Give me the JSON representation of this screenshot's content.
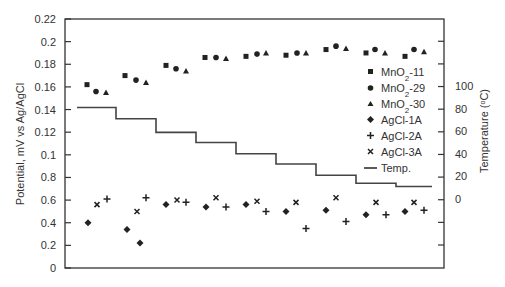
{
  "chart_data": {
    "type": "scatter",
    "title": "",
    "xlabel": "",
    "ylabel": "Potential, mV vs Ag/AgCl",
    "y2label": "Temperature (°C)",
    "y_tick_labels": [
      "0",
      "0.2",
      "0.4",
      "0.6",
      "0.8",
      "0.1",
      "0.12",
      "0.14",
      "0.16",
      "0.18",
      "0.2",
      "0.22"
    ],
    "y2_tick_labels": [
      "0",
      "20",
      "40",
      "60",
      "80",
      "100"
    ],
    "ylim": [
      0,
      0.22
    ],
    "y2lim": [
      0,
      100
    ],
    "grid": false,
    "legend_position": "right-inside",
    "legend": [
      "MnO2-11",
      "MnO2-29",
      "MnO2-30",
      "AgCl-1A",
      "AgCl-2A",
      "AgCl-3A",
      "Temp."
    ],
    "series": [
      {
        "name": "MnO2-11",
        "marker": "square",
        "x": [
          87,
          125,
          166,
          205,
          246,
          286,
          326,
          366,
          405
        ],
        "values": [
          0.162,
          0.17,
          0.179,
          0.186,
          0.187,
          0.188,
          0.193,
          0.19,
          0.187
        ]
      },
      {
        "name": "MnO2-29",
        "marker": "circle",
        "x": [
          96,
          136,
          176,
          216,
          257,
          297,
          336,
          375,
          414
        ],
        "values": [
          0.156,
          0.166,
          0.176,
          0.186,
          0.189,
          0.19,
          0.196,
          0.193,
          0.193
        ]
      },
      {
        "name": "MnO2-30",
        "marker": "triangle",
        "x": [
          106,
          146,
          186,
          226,
          266,
          306,
          346,
          385,
          424
        ],
        "values": [
          0.155,
          0.164,
          0.174,
          0.185,
          0.19,
          0.19,
          0.194,
          0.19,
          0.191
        ]
      },
      {
        "name": "AgCl-1A",
        "marker": "diamond",
        "x": [
          88,
          127,
          140,
          166,
          206,
          246,
          286,
          326,
          366,
          405
        ],
        "values": [
          0.4,
          0.34,
          0.22,
          0.56,
          0.54,
          0.56,
          0.5,
          0.51,
          0.47,
          0.5
        ]
      },
      {
        "name": "AgCl-2A",
        "marker": "plus",
        "x": [
          107,
          146,
          186,
          226,
          266,
          306,
          346,
          386,
          424
        ],
        "values": [
          0.61,
          0.62,
          0.58,
          0.54,
          0.5,
          0.35,
          0.41,
          0.47,
          0.51
        ]
      },
      {
        "name": "AgCl-3A",
        "marker": "cross",
        "x": [
          97,
          137,
          177,
          216,
          257,
          296,
          336,
          376,
          414
        ],
        "values": [
          0.56,
          0.5,
          0.6,
          0.62,
          0.59,
          0.58,
          0.62,
          0.58,
          0.58
        ]
      },
      {
        "name": "Temp.",
        "type": "step",
        "axis": "right",
        "x_start": [
          77,
          116,
          156,
          196,
          236,
          276,
          316,
          356,
          396
        ],
        "x_end": [
          116,
          156,
          196,
          236,
          276,
          316,
          356,
          396,
          432
        ],
        "values": [
          81,
          71,
          59,
          50,
          40,
          31,
          21,
          14,
          11
        ]
      }
    ]
  },
  "legend": {
    "mno2_11": "MnO2-11",
    "mno2_29": "MnO2-29",
    "mno2_30": "MnO2-30",
    "agcl_1a": "AgCl-1A",
    "agcl_2a": "AgCl-2A",
    "agcl_3a": "AgCl-3A",
    "temp": "Temp."
  },
  "axes": {
    "ylabel": "Potential, mV vs Ag/AgCl",
    "y2label": "Temperature (°C)"
  }
}
